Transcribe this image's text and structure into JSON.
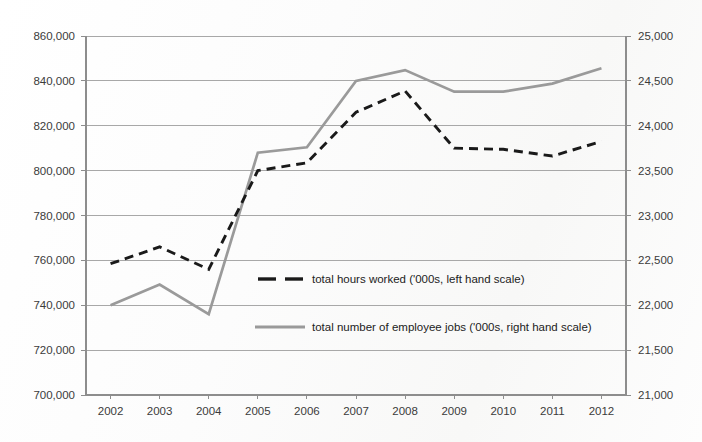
{
  "chart_data": {
    "type": "line",
    "title": "",
    "subtitle": "",
    "xlabel": "",
    "ylabel": "",
    "grid": true,
    "legend_position": "inside-center",
    "categories": [
      "2002",
      "2003",
      "2004",
      "2005",
      "2006",
      "2007",
      "2008",
      "2009",
      "2010",
      "2011",
      "2012"
    ],
    "axes": {
      "left": {
        "label": "",
        "ylim": [
          700000,
          860000
        ],
        "step": 20000,
        "ticks": [
          700000,
          720000,
          740000,
          760000,
          780000,
          800000,
          820000,
          840000,
          860000
        ],
        "tick_labels": [
          "700,000",
          "720,000",
          "740,000",
          "760,000",
          "780,000",
          "800,000",
          "820,000",
          "840,000",
          "860,000"
        ]
      },
      "right": {
        "label": "",
        "ylim": [
          21000,
          25000
        ],
        "step": 500,
        "ticks": [
          21000,
          21500,
          22000,
          22500,
          23000,
          23500,
          24000,
          24500,
          25000
        ],
        "tick_labels": [
          "21,000",
          "21,500",
          "22,000",
          "22,500",
          "23,000",
          "23,500",
          "24,000",
          "24,500",
          "25,000"
        ]
      }
    },
    "series": [
      {
        "name": "total hours worked ('000s, left hand scale)",
        "axis": "left",
        "style": "dashed",
        "color": "#1a1a1a",
        "values": [
          758500,
          766000,
          756000,
          800000,
          803500,
          826000,
          835500,
          810000,
          809500,
          806500,
          813000
        ]
      },
      {
        "name": "total number of employee jobs ('000s, right hand scale)",
        "axis": "right",
        "style": "solid",
        "color": "#9a9a9a",
        "values": [
          22000,
          22230,
          21900,
          23700,
          23760,
          24500,
          24620,
          24380,
          24380,
          24470,
          24640
        ]
      }
    ]
  },
  "legend": {
    "entries": [
      {
        "label": "total hours worked ('000s, left hand scale)",
        "style": "dashed",
        "color": "#1a1a1a"
      },
      {
        "label": "total number of employee jobs ('000s, right hand scale)",
        "style": "solid",
        "color": "#9a9a9a"
      }
    ]
  },
  "colors": {
    "background": "#ffffff",
    "gridline": "#a8a8a8",
    "axis": "#8d8d8d",
    "hours_series": "#1a1a1a",
    "jobs_series": "#9a9a9a",
    "text": "#3b3b3b"
  }
}
